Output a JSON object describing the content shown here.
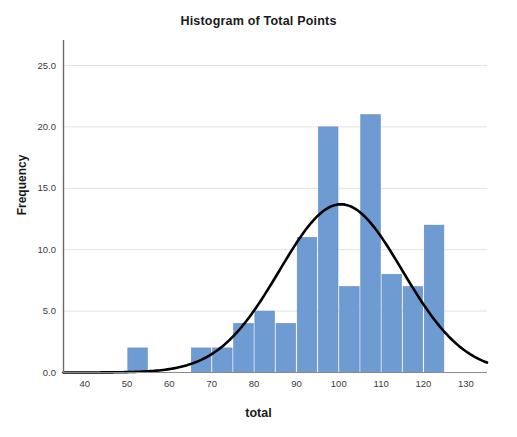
{
  "chart_data": {
    "type": "bar",
    "title": "Histogram of Total Points",
    "xlabel": "total",
    "ylabel": "Frequency",
    "xlim": [
      35,
      135
    ],
    "ylim": [
      0,
      27
    ],
    "grid": true,
    "legend": "none",
    "bin_width": 5,
    "bar_color": "#6E9CD2",
    "curve_color": "#000000",
    "categories": [
      "50-55",
      "55-60",
      "60-65",
      "65-70",
      "70-75",
      "75-80",
      "80-85",
      "85-90",
      "90-95",
      "95-100",
      "100-105",
      "105-110",
      "110-115",
      "115-120",
      "120-125"
    ],
    "bin_starts": [
      50,
      55,
      60,
      65,
      70,
      75,
      80,
      85,
      90,
      95,
      100,
      105,
      110,
      115,
      120
    ],
    "values": [
      2,
      0,
      0,
      2,
      2,
      4,
      5,
      4,
      11,
      20,
      7,
      21,
      8,
      7,
      12
    ],
    "x_ticks": [
      40,
      50,
      60,
      70,
      80,
      90,
      100,
      110,
      120,
      130
    ],
    "x_tick_labels": [
      "40",
      "50",
      "60",
      "70",
      "80",
      "90",
      "100",
      "110",
      "120",
      "130"
    ],
    "y_ticks": [
      0,
      5,
      10,
      15,
      20,
      25
    ],
    "y_tick_labels": [
      "0.0",
      "5.0",
      "10.0",
      "15.0",
      "20.0",
      "25.0"
    ],
    "overlay": {
      "type": "normal-curve",
      "mean": 100.5,
      "std_dev": 14.5,
      "peak_value": 13.7,
      "n": 105
    }
  }
}
